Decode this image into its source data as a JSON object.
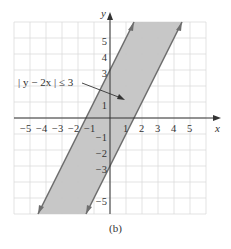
{
  "chart_data": {
    "type": "area",
    "title": "",
    "subtitle": "",
    "caption": "(b)",
    "xlabel": "x",
    "ylabel": "y",
    "xlim": [
      -6,
      6
    ],
    "ylim": [
      -6,
      6
    ],
    "grid": true,
    "x_ticks": [
      -5,
      -4,
      -3,
      -2,
      -1,
      1,
      2,
      3,
      4,
      5
    ],
    "y_ticks": [
      -5,
      -3,
      -2,
      -1,
      1,
      3,
      4,
      5
    ],
    "x_tick_labels": [
      "−5",
      "−4",
      "−3",
      "−2",
      "−1",
      "1",
      "2",
      "3",
      "4",
      "5"
    ],
    "y_tick_labels": [
      "−5",
      "−3",
      "−2",
      "−1",
      "1",
      "3",
      "4",
      "5"
    ],
    "series": [
      {
        "name": "upper boundary",
        "equation": "y = 2x + 3",
        "style": "solid",
        "points": [
          [
            -4.5,
            -6
          ],
          [
            1.5,
            6
          ]
        ]
      },
      {
        "name": "lower boundary",
        "equation": "y = 2x − 3",
        "style": "solid",
        "points": [
          [
            -1.5,
            -6
          ],
          [
            4.5,
            6
          ]
        ]
      }
    ],
    "shaded_region": {
      "inequality": "|y − 2x| ≤ 3",
      "color": "#c4c4c4"
    },
    "annotations": [
      {
        "text": "| y − 2x | ≤ 3",
        "label_position": [
          -4.3,
          2.3
        ],
        "arrow_to": [
          0.9,
          1.2
        ]
      }
    ],
    "colors": {
      "shade": "#c4c4c4",
      "boundary": "#6e6e6e",
      "grid": "#d9d9d9",
      "axis": "#333333"
    }
  },
  "labels": {
    "x_axis": "x",
    "y_axis": "y",
    "annotation": "| y − 2x | ≤ 3",
    "caption": "(b)",
    "xticks": [
      "−5",
      "−4",
      "−3",
      "−2",
      "−1",
      "1",
      "2",
      "3",
      "4",
      "5"
    ],
    "yticks": [
      "5",
      "4",
      "3",
      "1",
      "−1",
      "−2",
      "−3",
      "−5"
    ]
  }
}
